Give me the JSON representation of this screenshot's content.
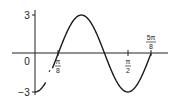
{
  "chart_data": {
    "type": "line",
    "title": "",
    "xlabel": "",
    "ylabel": "",
    "function": "y = -3 cos(4x)",
    "series": [
      {
        "name": "sinusoid",
        "x": [
          0,
          0.19635,
          0.392699,
          0.589049,
          0.785398,
          0.981748,
          1.178097,
          1.374447,
          1.570796,
          1.767146,
          1.963495
        ],
        "x_labels": [
          "0",
          "π/16",
          "π/8",
          "3π/16",
          "π/4",
          "5π/16",
          "3π/8",
          "7π/16",
          "π/2",
          "9π/16",
          "5π/8"
        ],
        "values": [
          -3,
          -2.12,
          0,
          2.12,
          3,
          2.12,
          0,
          -2.12,
          -3,
          -2.12,
          0
        ]
      }
    ],
    "x_ticks": [
      {
        "value": 0.392699,
        "label_num": "π",
        "label_den": "8"
      },
      {
        "value": 1.570796,
        "label_num": "π",
        "label_den": "2"
      },
      {
        "value": 1.963495,
        "label_num": "5π",
        "label_den": "8"
      }
    ],
    "y_ticks": [
      {
        "value": 3,
        "label": "3"
      },
      {
        "value": -3,
        "label": "−3"
      }
    ],
    "origin_label": "0",
    "xlim": [
      0,
      1.963495
    ],
    "ylim": [
      -3,
      3
    ],
    "grid": false,
    "legend": "none",
    "line_color": "#1a1a1a"
  }
}
